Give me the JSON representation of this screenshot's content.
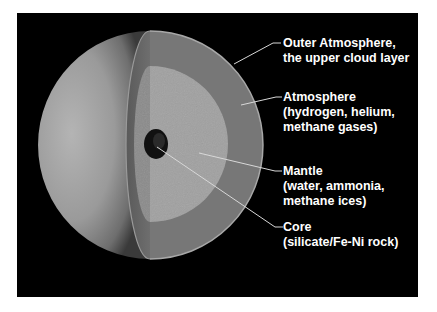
{
  "diagram": {
    "colors": {
      "background": "#000000",
      "page": "#ffffff",
      "outer_shell": "#767676",
      "mantle": "#9c9c9c",
      "core": "#111111",
      "label_text": "#ffffff",
      "leader_line": "#d8d8d8"
    },
    "labels": [
      {
        "id": "outer-atmosphere",
        "lines": [
          "Outer Atmosphere,",
          "the upper cloud layer"
        ]
      },
      {
        "id": "atmosphere",
        "lines": [
          "Atmosphere",
          "(hydrogen, helium,",
          "methane gases)"
        ]
      },
      {
        "id": "mantle",
        "lines": [
          "Mantle",
          "(water, ammonia,",
          "methane ices)"
        ]
      },
      {
        "id": "core",
        "lines": [
          "Core",
          "(silicate/Fe-Ni rock)"
        ]
      }
    ]
  }
}
